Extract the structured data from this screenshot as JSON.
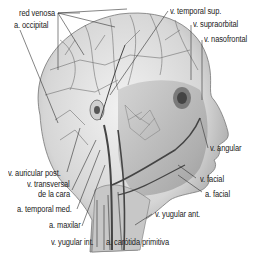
{
  "diagram": {
    "colors": {
      "background": "#ffffff",
      "label_text": "#222222",
      "leader_line": "#333333",
      "skin_light": "#e6e6e6",
      "skin_mid": "#bdbdbd",
      "vessel": "#555555"
    },
    "labels": [
      {
        "id": "red-venosa",
        "text": "red venosa"
      },
      {
        "id": "a-occipital",
        "text": "a. occipital"
      },
      {
        "id": "v-temporal-sup",
        "text": "v. temporal sup."
      },
      {
        "id": "v-supraorbital",
        "text": "v. supraorbital"
      },
      {
        "id": "v-nasofrontal",
        "text": "v. nasofrontal"
      },
      {
        "id": "v-angular",
        "text": "v. angular"
      },
      {
        "id": "v-facial",
        "text": "v. facial"
      },
      {
        "id": "a-facial",
        "text": "a. facial"
      },
      {
        "id": "v-auricular-post",
        "text": "v. auricular post."
      },
      {
        "id": "v-transversal-1",
        "text": "v. transversal"
      },
      {
        "id": "v-transversal-2",
        "text": "de la cara"
      },
      {
        "id": "a-temporal-med",
        "text": "a. temporal med."
      },
      {
        "id": "a-maxilar",
        "text": "a. maxilar"
      },
      {
        "id": "v-yugular-int",
        "text": "v. yugular int."
      },
      {
        "id": "a-carotida-primitiva",
        "text": "a. carótida primitiva"
      },
      {
        "id": "v-yugular-ant",
        "text": "v. yugular ant."
      }
    ]
  }
}
